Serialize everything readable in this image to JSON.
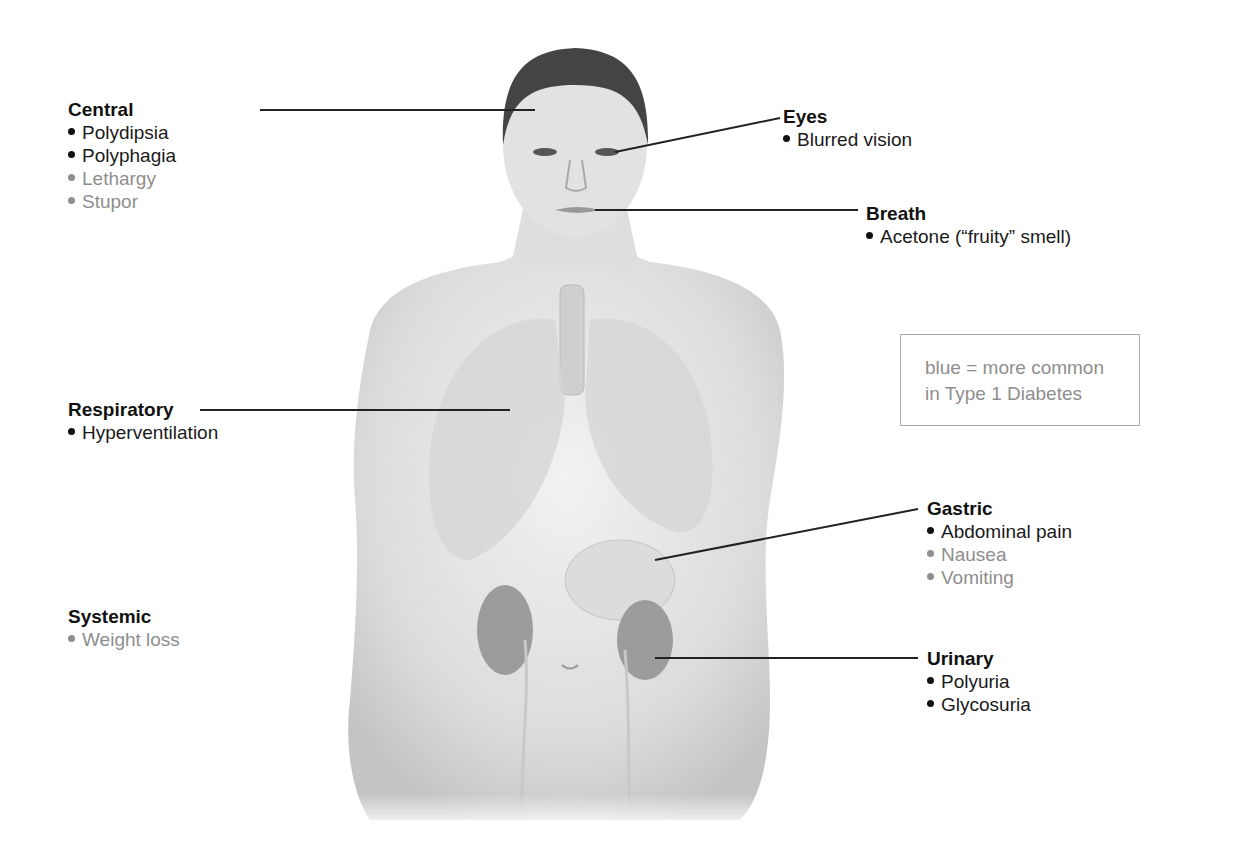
{
  "figure": {
    "colors": {
      "common_text": "#1a1a1a",
      "type1_text": "#8e8e8e",
      "leader_line": "#222222",
      "body_fill": "#e4e4e4",
      "organ_fill": "#9a9a9a"
    }
  },
  "legend": {
    "line1": "blue = more common",
    "line2": "in Type 1 Diabetes"
  },
  "groups": {
    "central": {
      "title": "Central",
      "items": [
        {
          "text": "Polydipsia",
          "type1": false
        },
        {
          "text": "Polyphagia",
          "type1": false
        },
        {
          "text": "Lethargy",
          "type1": true
        },
        {
          "text": "Stupor",
          "type1": true
        }
      ]
    },
    "eyes": {
      "title": "Eyes",
      "items": [
        {
          "text": "Blurred vision",
          "type1": false
        }
      ]
    },
    "breath": {
      "title": "Breath",
      "items": [
        {
          "text": "Acetone (“fruity” smell)",
          "type1": false
        }
      ]
    },
    "respiratory": {
      "title": "Respiratory",
      "items": [
        {
          "text": "Hyperventilation",
          "type1": false
        }
      ]
    },
    "gastric": {
      "title": "Gastric",
      "items": [
        {
          "text": "Abdominal pain",
          "type1": false
        },
        {
          "text": "Nausea",
          "type1": true
        },
        {
          "text": "Vomiting",
          "type1": true
        }
      ]
    },
    "systemic": {
      "title": "Systemic",
      "items": [
        {
          "text": "Weight loss",
          "type1": true
        }
      ]
    },
    "urinary": {
      "title": "Urinary",
      "items": [
        {
          "text": "Polyuria",
          "type1": false
        },
        {
          "text": "Glycosuria",
          "type1": false
        }
      ]
    }
  }
}
